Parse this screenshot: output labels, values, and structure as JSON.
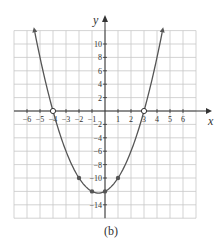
{
  "chart_data": {
    "type": "line",
    "title": "",
    "caption": "(b)",
    "xlabel": "x",
    "ylabel": "y",
    "xlim": [
      -7,
      7
    ],
    "ylim": [
      -16,
      12
    ],
    "grid": true,
    "x_ticks": [
      -6,
      -5,
      -4,
      -3,
      -2,
      -1,
      1,
      2,
      3,
      4,
      5,
      6
    ],
    "y_ticks": [
      10,
      8,
      6,
      4,
      2,
      -2,
      -4,
      -6,
      -8,
      -10,
      -14
    ],
    "function": "y = x^2 + x - 12",
    "curve_range": [
      -5.4,
      4.4
    ],
    "filled_points": [
      {
        "x": -2,
        "y": -10
      },
      {
        "x": -1,
        "y": -12
      },
      {
        "x": 0,
        "y": -12
      },
      {
        "x": 1,
        "y": -10
      }
    ],
    "open_points": [
      {
        "x": -4,
        "y": 0
      },
      {
        "x": 3,
        "y": 0
      }
    ],
    "colors": {
      "grid": "#c8c8c8",
      "axis": "#333333",
      "curve": "#555555",
      "text": "#333333"
    }
  }
}
